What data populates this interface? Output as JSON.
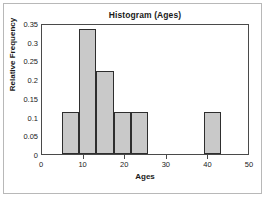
{
  "chart_data": {
    "type": "bar",
    "title": "Histogram (Ages)",
    "xlabel": "Ages",
    "ylabel": "Relative Frequency",
    "xlim": [
      0,
      50
    ],
    "ylim": [
      0,
      0.35
    ],
    "grid": false,
    "legend": null,
    "xticks": [
      0,
      10,
      20,
      30,
      40,
      50
    ],
    "xtick_labels": [
      "0",
      "10",
      "20",
      "30",
      "40",
      "50"
    ],
    "yticks": [
      0,
      0.05,
      0.1,
      0.15,
      0.2,
      0.25,
      0.3,
      0.35
    ],
    "ytick_labels": [
      "0",
      "0.05",
      "0.1",
      "0.15",
      "0.2",
      "0.25",
      "0.3",
      "0.35"
    ],
    "bin_edges": [
      4.7,
      8.9,
      13.0,
      17.2,
      21.4,
      25.6
    ],
    "bars": [
      {
        "bin_start": 4.7,
        "bin_end": 8.9,
        "value": 0.111
      },
      {
        "bin_start": 8.9,
        "bin_end": 13.0,
        "value": 0.333
      },
      {
        "bin_start": 13.0,
        "bin_end": 17.2,
        "value": 0.222
      },
      {
        "bin_start": 17.2,
        "bin_end": 21.4,
        "value": 0.111
      },
      {
        "bin_start": 21.4,
        "bin_end": 25.6,
        "value": 0.111
      },
      {
        "bin_start": 38.9,
        "bin_end": 43.1,
        "value": 0.111
      }
    ],
    "categories": [
      "4.7-8.9",
      "8.9-13.0",
      "13.0-17.2",
      "17.2-21.4",
      "21.4-25.6",
      "38.9-43.1"
    ],
    "values": [
      0.111,
      0.333,
      0.222,
      0.111,
      0.111,
      0.111
    ],
    "colors": {
      "bar_fill": "#c9c9c9",
      "bar_edge": "#2e2e2e",
      "axis": "#4a4a4a",
      "text": "#1a1a1a",
      "frame": "#b8b8b8",
      "background": "#ffffff"
    }
  }
}
